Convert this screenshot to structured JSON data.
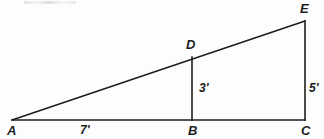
{
  "figure": {
    "type": "geometry-diagram",
    "background_color": "#fdfdfd",
    "stroke_color": "#1d1d1d",
    "points": {
      "A": {
        "label": "A",
        "x": 12,
        "y": 120,
        "label_x": 7,
        "label_y": 124
      },
      "B": {
        "label": "B",
        "x": 192,
        "y": 120,
        "label_x": 188,
        "label_y": 124
      },
      "C": {
        "label": "C",
        "x": 305,
        "y": 120,
        "label_x": 301,
        "label_y": 124
      },
      "D": {
        "label": "D",
        "x": 192,
        "y": 57,
        "label_x": 186,
        "label_y": 38
      },
      "E": {
        "label": "E",
        "x": 305,
        "y": 21,
        "label_x": 300,
        "label_y": 2
      }
    },
    "segments": [
      {
        "name": "hypotenuse-A-E",
        "from": "A",
        "to": "E"
      },
      {
        "name": "base-A-C",
        "from": "A",
        "to": "C"
      },
      {
        "name": "altitude-D-B",
        "from": "D",
        "to": "B"
      },
      {
        "name": "altitude-E-C",
        "from": "E",
        "to": "C"
      }
    ],
    "measurements": [
      {
        "name": "segment-AB-length",
        "text": "7'",
        "value": 7,
        "unit": "feet",
        "x": 80,
        "y": 124
      },
      {
        "name": "segment-DB-length",
        "text": "3'",
        "value": 3,
        "unit": "feet",
        "x": 199,
        "y": 82
      },
      {
        "name": "segment-EC-length",
        "text": "5'",
        "value": 5,
        "unit": "feet",
        "x": 309,
        "y": 82
      }
    ]
  }
}
